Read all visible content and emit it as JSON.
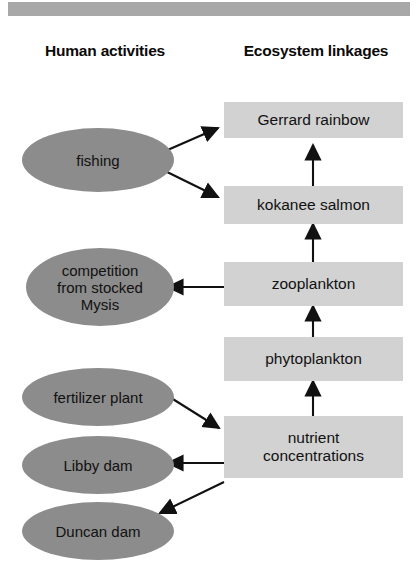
{
  "figure": {
    "title_bar": "",
    "headers": {
      "left": "Human\nactivities",
      "left_line1": "Human",
      "left_line2": "activities",
      "right_line1": "Ecosystem",
      "right_line2": "linkages"
    },
    "colors": {
      "top_bar": "#a8a8a8",
      "ellipse_fill": "#8c8c8c",
      "box_fill": "#d2d2d2",
      "arrow": "#111111",
      "text": "#111111",
      "background": "#ffffff"
    }
  },
  "human_activities": [
    {
      "id": "fishing",
      "label": "fishing"
    },
    {
      "id": "mysis",
      "label": "competition\nfrom stocked\nMysis",
      "line1": "competition",
      "line2": "from stocked",
      "line3": "Mysis"
    },
    {
      "id": "fertilizer",
      "label": "fertilizer plant"
    },
    {
      "id": "libby",
      "label": "Libby dam"
    },
    {
      "id": "duncan",
      "label": "Duncan dam"
    }
  ],
  "ecosystem_linkages": [
    {
      "id": "gerrard",
      "label": "Gerrard rainbow"
    },
    {
      "id": "kokanee",
      "label": "kokanee salmon"
    },
    {
      "id": "zooplankton",
      "label": "zooplankton"
    },
    {
      "id": "phytoplankton",
      "label": "phytoplankton"
    },
    {
      "id": "nutrients",
      "label": "nutrient\nconcentrations",
      "line1": "nutrient",
      "line2": "concentrations"
    }
  ],
  "links": [
    {
      "from": "fishing",
      "to": "gerrard",
      "style": "arrow"
    },
    {
      "from": "fishing",
      "to": "kokanee",
      "style": "arrow"
    },
    {
      "from": "kokanee",
      "to": "gerrard",
      "style": "arrow"
    },
    {
      "from": "zooplankton",
      "to": "kokanee",
      "style": "arrow"
    },
    {
      "from": "zooplankton",
      "to": "mysis",
      "style": "arrow"
    },
    {
      "from": "phytoplankton",
      "to": "zooplankton",
      "style": "arrow"
    },
    {
      "from": "nutrients",
      "to": "phytoplankton",
      "style": "arrow"
    },
    {
      "from": "fertilizer",
      "to": "nutrients",
      "style": "arrow"
    },
    {
      "from": "nutrients",
      "to": "libby",
      "style": "arrow"
    },
    {
      "from": "nutrients",
      "to": "duncan",
      "style": "arrow"
    }
  ]
}
